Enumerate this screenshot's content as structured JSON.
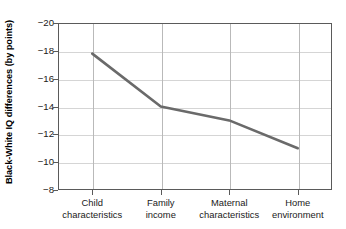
{
  "chart_data": {
    "type": "line",
    "title": "",
    "xlabel": "",
    "ylabel": "Black-White IQ differences (by points)",
    "categories": [
      "Child characteristics",
      "Family income",
      "Maternal characteristics",
      "Home environment"
    ],
    "category_lines": [
      [
        "Child",
        "characteristics"
      ],
      [
        "Family",
        "income"
      ],
      [
        "Maternal",
        "characteristics"
      ],
      [
        "Home",
        "environment"
      ]
    ],
    "values": [
      -17.8,
      -14.0,
      -13.0,
      -11.0
    ],
    "ylim": [
      -20,
      -8
    ],
    "y_ticks": [
      -20,
      -18,
      -16,
      -14,
      -12,
      -10,
      -8
    ],
    "y_tick_labels": [
      "−20",
      "−18",
      "−16",
      "−14",
      "−12",
      "−10",
      "−8"
    ],
    "y_axis_inverted": true,
    "grid": "both",
    "legend": "none",
    "series": [
      {
        "name": "Black-White IQ difference",
        "values": [
          -17.8,
          -14.0,
          -13.0,
          -11.0
        ]
      }
    ],
    "line_color": "#6a6a6a",
    "grid_color": "#d5d5d5",
    "axis_color": "#5a5a5a"
  }
}
